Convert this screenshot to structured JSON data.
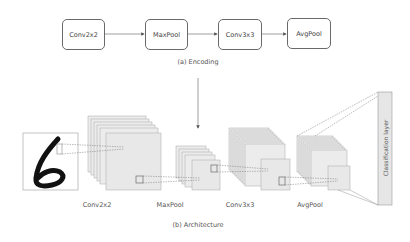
{
  "encoding": {
    "caption": "(a) Encoding",
    "nodes": [
      {
        "label": "Conv2x2"
      },
      {
        "label": "MaxPool"
      },
      {
        "label": "Conv3x3"
      },
      {
        "label": "AvgPool"
      }
    ]
  },
  "architecture": {
    "caption": "(b) Architecture",
    "input_digit": "6",
    "layers": [
      {
        "label": "Conv2x2"
      },
      {
        "label": "MaxPool"
      },
      {
        "label": "Conv3x3"
      },
      {
        "label": "AvgPool"
      }
    ],
    "classification_label": "Classification layer"
  },
  "colors": {
    "box_stroke": "#6a6a6a",
    "layer_fill": "#ececec",
    "layer_stroke": "#9a9a9a",
    "line": "#777777"
  }
}
